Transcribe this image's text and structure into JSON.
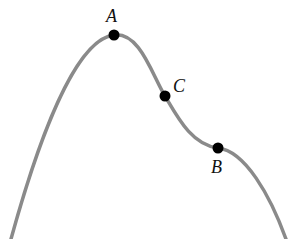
{
  "diagram": {
    "curve_color": "#8a8a8a",
    "point_color": "#000000",
    "points": [
      {
        "label": "A",
        "x": 114,
        "y": 35,
        "label_x": 106,
        "label_y": 22
      },
      {
        "label": "C",
        "x": 165,
        "y": 96,
        "label_x": 173,
        "label_y": 92
      },
      {
        "label": "B",
        "x": 218,
        "y": 148,
        "label_x": 212,
        "label_y": 172
      }
    ]
  }
}
